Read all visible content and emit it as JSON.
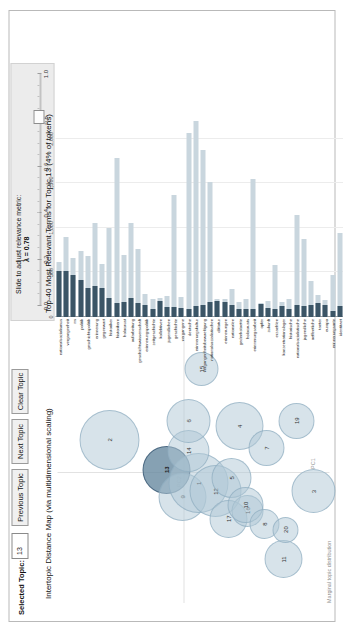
{
  "app": {
    "type": "pyLDAvis topic model visualization"
  },
  "controls": {
    "selected_topic_label": "Selected Topic:",
    "selected_topic_value": "13",
    "previous_topic_label": "Previous Topic",
    "next_topic_label": "Next Topic",
    "clear_topic_label": "Clear Topic"
  },
  "slider": {
    "title": "Slide to adjust relevance metric:",
    "superscript": "(2)",
    "lambda_label": "λ = 0.78",
    "value": 0.78,
    "min": 0.0,
    "max": 1.0,
    "ticks": [
      "0.0",
      "0.2",
      "0.4",
      "0.6",
      "0.8",
      "1.0"
    ],
    "tick_values": [
      0.0,
      0.2,
      0.4,
      0.6,
      0.8,
      1.0
    ]
  },
  "left_panel": {
    "title": "Intertopic Distance Map (via multidimensional scaling)",
    "xlabel": "PC1",
    "ylabel": "PC2",
    "legend_caption": "Marginal topic distribution"
  },
  "right_panel": {
    "title": "Top-40 Most Relevant Terms for Topic 13 (4% of tokens)"
  },
  "chart_data": [
    {
      "type": "scatter",
      "name": "intertopic-distance-map",
      "title": "Intertopic Distance Map (via multidimensional scaling)",
      "xlabel": "PC1",
      "ylabel": "PC2",
      "grid": true,
      "legend": "Marginal topic distribution",
      "selected_topic": 13,
      "points": [
        {
          "topic": 2,
          "x": 0.6,
          "y": 0.81,
          "r": 30
        },
        {
          "topic": 13,
          "x": 0.49,
          "y": 0.6,
          "r": 24,
          "selected": true
        },
        {
          "topic": 9,
          "x": 0.39,
          "y": 0.54,
          "r": 24
        },
        {
          "topic": 1,
          "x": 0.44,
          "y": 0.48,
          "r": 30
        },
        {
          "topic": 12,
          "x": 0.41,
          "y": 0.42,
          "r": 26
        },
        {
          "topic": 14,
          "x": 0.56,
          "y": 0.52,
          "r": 21
        },
        {
          "topic": 6,
          "x": 0.67,
          "y": 0.52,
          "r": 22
        },
        {
          "topic": 5,
          "x": 0.46,
          "y": 0.36,
          "r": 20
        },
        {
          "topic": 17,
          "x": 0.31,
          "y": 0.37,
          "r": 19
        },
        {
          "topic": 16,
          "x": 0.34,
          "y": 0.3,
          "r": 16
        },
        {
          "topic": 10,
          "x": 0.36,
          "y": 0.31,
          "r": 18
        },
        {
          "topic": 8,
          "x": 0.29,
          "y": 0.24,
          "r": 15
        },
        {
          "topic": 11,
          "x": 0.16,
          "y": 0.17,
          "r": 19
        },
        {
          "topic": 20,
          "x": 0.27,
          "y": 0.16,
          "r": 13
        },
        {
          "topic": 4,
          "x": 0.65,
          "y": 0.33,
          "r": 24
        },
        {
          "topic": 7,
          "x": 0.57,
          "y": 0.23,
          "r": 18
        },
        {
          "topic": 19,
          "x": 0.67,
          "y": 0.12,
          "r": 18
        },
        {
          "topic": 3,
          "x": 0.41,
          "y": 0.06,
          "r": 22
        },
        {
          "topic": 15,
          "x": 0.86,
          "y": 0.47,
          "r": 17
        }
      ]
    },
    {
      "type": "bar",
      "name": "top-relevant-terms",
      "title": "Top-40 Most Relevant Terms for Topic 13 (4% of tokens)",
      "orientation": "horizontal",
      "xlabel": "",
      "ylabel": "",
      "xlim": [
        0,
        2200
      ],
      "ticks": [
        0,
        500,
        1000,
        1500,
        2000
      ],
      "tick_labels": [
        "0",
        "500",
        "1,000",
        "1,500",
        "2,000"
      ],
      "series": [
        {
          "name": "Overall term frequency",
          "color": "#c9d6de"
        },
        {
          "name": "Estimated term frequency within the selected topic",
          "color": "#3b5566"
        }
      ],
      "categories": [
        "nationalsozialismus",
        "vergangenheit",
        "ns",
        "politik",
        "geschichtspolitik",
        "erinnerung",
        "gegenwart",
        "historiker",
        "historikern",
        "holocaust",
        "aufarbeitung",
        "geschichtswissenschaft",
        "erinnerungspolitik",
        "zeitgeschichte",
        "kollektiven",
        "jugendlichen",
        "geschichte",
        "vergangene",
        "deutsche",
        "erinnerungskultur",
        "vergangenheitsbewaeltigung",
        "nationalsozialistischen",
        "diktatur",
        "erinnerungen",
        "nationalen",
        "gedenkstaette",
        "holocausts",
        "erinnerungsarbeit",
        "opfer",
        "zukunft",
        "erzaehlen",
        "konzentrationslager",
        "historische",
        "nationalsozialistische",
        "jugendliche",
        "oeffentliche",
        "taeter",
        "europa",
        "erinnerungsorte",
        "identitaet"
      ],
      "overall_values": [
        612,
        900,
        660,
        740,
        690,
        1060,
        600,
        1000,
        1780,
        700,
        1050,
        760,
        260,
        200,
        210,
        240,
        1370,
        230,
        2070,
        2200,
        1870,
        1510,
        200,
        200,
        310,
        170,
        200,
        1550,
        160,
        180,
        580,
        170,
        200,
        1140,
        870,
        400,
        250,
        190,
        470,
        940
      ],
      "topic_values": [
        512,
        520,
        470,
        415,
        330,
        345,
        330,
        215,
        160,
        165,
        210,
        160,
        130,
        95,
        180,
        110,
        110,
        105,
        95,
        120,
        130,
        165,
        175,
        170,
        130,
        90,
        95,
        85,
        145,
        100,
        95,
        120,
        85,
        130,
        120,
        140,
        160,
        130,
        70,
        125
      ]
    }
  ]
}
